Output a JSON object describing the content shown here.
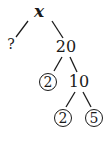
{
  "diagram": {
    "type": "factor-tree",
    "nodes": [
      {
        "id": "root",
        "label": "x",
        "circled": false,
        "x": 39,
        "y": 11
      },
      {
        "id": "unknown",
        "label": "?",
        "circled": false,
        "x": 11,
        "y": 44
      },
      {
        "id": "n20",
        "label": "20",
        "circled": false,
        "x": 66,
        "y": 47
      },
      {
        "id": "p2a",
        "label": "2",
        "circled": true,
        "x": 48,
        "y": 82
      },
      {
        "id": "n10",
        "label": "10",
        "circled": false,
        "x": 79,
        "y": 82
      },
      {
        "id": "p2b",
        "label": "2",
        "circled": true,
        "x": 63,
        "y": 118
      },
      {
        "id": "p5",
        "label": "5",
        "circled": true,
        "x": 94,
        "y": 118
      }
    ],
    "edges": [
      {
        "from": "root",
        "to": "unknown"
      },
      {
        "from": "root",
        "to": "n20"
      },
      {
        "from": "n20",
        "to": "p2a"
      },
      {
        "from": "n20",
        "to": "n10"
      },
      {
        "from": "n10",
        "to": "p2b"
      },
      {
        "from": "n10",
        "to": "p5"
      }
    ],
    "line_color": "#1a1a1a"
  }
}
